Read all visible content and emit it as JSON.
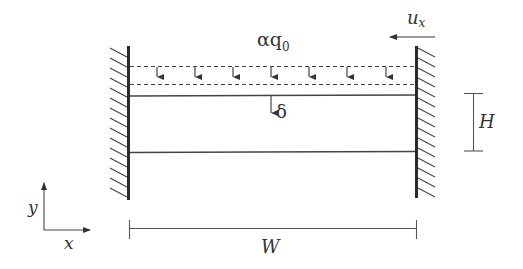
{
  "diagram": {
    "labels": {
      "load": "αq",
      "load_subscript": "0",
      "deflection": "δ",
      "velocity": "u",
      "velocity_subscript": "x",
      "height": "H",
      "width": "W",
      "axis_x": "x",
      "axis_y": "y"
    },
    "load_arrow_count": 7,
    "colors": {
      "stroke": "#333333",
      "wall": "#2a2a2a",
      "background": "#ffffff"
    }
  }
}
